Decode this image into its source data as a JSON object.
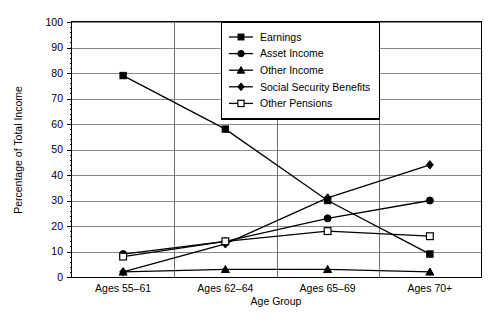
{
  "chart_data": {
    "type": "line",
    "title": "",
    "xlabel": "Age Group",
    "ylabel": "Percentage of Total Income",
    "categories": [
      "Ages 55–61",
      "Ages 62–64",
      "Ages 65–69",
      "Ages 70+"
    ],
    "ylim": [
      0,
      100
    ],
    "ytick_step": 10,
    "yticks": [
      "0",
      "10",
      "20",
      "30",
      "40",
      "50",
      "60",
      "70",
      "80",
      "90",
      "100"
    ],
    "grid": true,
    "legend_position": "top-right-inside",
    "series": [
      {
        "name": "Earnings",
        "marker": "filled-square",
        "values": [
          79,
          58,
          30,
          9
        ]
      },
      {
        "name": "Asset Income",
        "marker": "filled-circle",
        "values": [
          9,
          14,
          23,
          30
        ]
      },
      {
        "name": "Other Income",
        "marker": "filled-triangle",
        "values": [
          2,
          3,
          3,
          2
        ]
      },
      {
        "name": "Social Security Benefits",
        "marker": "filled-diamond",
        "values": [
          2,
          13,
          31,
          44
        ]
      },
      {
        "name": "Other Pensions",
        "marker": "open-square",
        "values": [
          8,
          14,
          18,
          16
        ]
      }
    ]
  },
  "axes": {
    "y_axis_label": "Percentage of Total Income",
    "x_axis_label": "Age Group"
  },
  "colors": {
    "ink": "#000000",
    "gridline": "#8a8a8a",
    "background": "#ffffff"
  }
}
